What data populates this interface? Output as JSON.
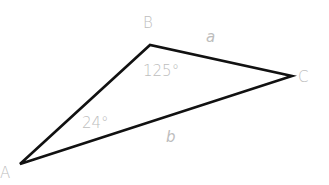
{
  "diagram": {
    "type": "triangle",
    "stroke_color": "#111111",
    "label_color": "#bdbdbd",
    "vertices": [
      {
        "id": "A",
        "label": "A",
        "x": 20,
        "y": 164
      },
      {
        "id": "B",
        "label": "B",
        "x": 150,
        "y": 45
      },
      {
        "id": "C",
        "label": "C",
        "x": 292,
        "y": 76
      }
    ],
    "sides": [
      {
        "id": "a",
        "label": "a",
        "between": [
          "B",
          "C"
        ]
      },
      {
        "id": "b",
        "label": "b",
        "between": [
          "A",
          "C"
        ]
      }
    ],
    "angles": [
      {
        "at": "B",
        "label": "125°"
      },
      {
        "at": "A",
        "label": "24°"
      }
    ]
  }
}
